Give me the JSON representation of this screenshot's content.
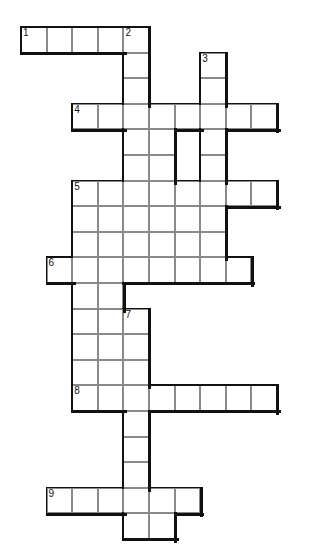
{
  "puzzle": {
    "type": "crossword-grid",
    "title": "",
    "cell_size": 25.6,
    "origin": {
      "x": 21,
      "y": 27
    },
    "cols": 11,
    "rows": 20,
    "colors": {
      "cell_fill": "#ffffff",
      "cell_border": "#8a8a8a",
      "heavy_border": "#111111",
      "number_text": "#111111",
      "background": "#ffffff"
    },
    "numbers": [
      {
        "label": "1",
        "col": 0,
        "row": 0
      },
      {
        "label": "2",
        "col": 4,
        "row": 0
      },
      {
        "label": "3",
        "col": 7,
        "row": 1
      },
      {
        "label": "4",
        "col": 2,
        "row": 3
      },
      {
        "label": "5",
        "col": 2,
        "row": 6
      },
      {
        "label": "6",
        "col": 1,
        "row": 9
      },
      {
        "label": "7",
        "col": 4,
        "row": 11
      },
      {
        "label": "8",
        "col": 2,
        "row": 14
      },
      {
        "label": "9",
        "col": 1,
        "row": 18
      }
    ],
    "cells": [
      {
        "col": 0,
        "row": 0
      },
      {
        "col": 1,
        "row": 0
      },
      {
        "col": 2,
        "row": 0
      },
      {
        "col": 3,
        "row": 0
      },
      {
        "col": 4,
        "row": 0
      },
      {
        "col": 4,
        "row": 1
      },
      {
        "col": 7,
        "row": 1
      },
      {
        "col": 4,
        "row": 2
      },
      {
        "col": 7,
        "row": 2
      },
      {
        "col": 2,
        "row": 3
      },
      {
        "col": 3,
        "row": 3
      },
      {
        "col": 4,
        "row": 3
      },
      {
        "col": 5,
        "row": 3
      },
      {
        "col": 6,
        "row": 3
      },
      {
        "col": 7,
        "row": 3
      },
      {
        "col": 8,
        "row": 3
      },
      {
        "col": 9,
        "row": 3
      },
      {
        "col": 4,
        "row": 4
      },
      {
        "col": 5,
        "row": 4
      },
      {
        "col": 7,
        "row": 4
      },
      {
        "col": 4,
        "row": 5
      },
      {
        "col": 5,
        "row": 5
      },
      {
        "col": 7,
        "row": 5
      },
      {
        "col": 2,
        "row": 6
      },
      {
        "col": 3,
        "row": 6
      },
      {
        "col": 4,
        "row": 6
      },
      {
        "col": 5,
        "row": 6
      },
      {
        "col": 6,
        "row": 6
      },
      {
        "col": 7,
        "row": 6
      },
      {
        "col": 8,
        "row": 6
      },
      {
        "col": 9,
        "row": 6
      },
      {
        "col": 2,
        "row": 7
      },
      {
        "col": 3,
        "row": 7
      },
      {
        "col": 4,
        "row": 7
      },
      {
        "col": 5,
        "row": 7
      },
      {
        "col": 6,
        "row": 7
      },
      {
        "col": 7,
        "row": 7
      },
      {
        "col": 2,
        "row": 8
      },
      {
        "col": 3,
        "row": 8
      },
      {
        "col": 4,
        "row": 8
      },
      {
        "col": 5,
        "row": 8
      },
      {
        "col": 6,
        "row": 8
      },
      {
        "col": 7,
        "row": 8
      },
      {
        "col": 1,
        "row": 9
      },
      {
        "col": 2,
        "row": 9
      },
      {
        "col": 3,
        "row": 9
      },
      {
        "col": 4,
        "row": 9
      },
      {
        "col": 5,
        "row": 9
      },
      {
        "col": 6,
        "row": 9
      },
      {
        "col": 7,
        "row": 9
      },
      {
        "col": 8,
        "row": 9
      },
      {
        "col": 2,
        "row": 10
      },
      {
        "col": 3,
        "row": 10
      },
      {
        "col": 2,
        "row": 11
      },
      {
        "col": 3,
        "row": 11
      },
      {
        "col": 4,
        "row": 11
      },
      {
        "col": 2,
        "row": 12
      },
      {
        "col": 3,
        "row": 12
      },
      {
        "col": 4,
        "row": 12
      },
      {
        "col": 2,
        "row": 13
      },
      {
        "col": 3,
        "row": 13
      },
      {
        "col": 4,
        "row": 13
      },
      {
        "col": 2,
        "row": 14
      },
      {
        "col": 3,
        "row": 14
      },
      {
        "col": 4,
        "row": 14
      },
      {
        "col": 5,
        "row": 14
      },
      {
        "col": 6,
        "row": 14
      },
      {
        "col": 7,
        "row": 14
      },
      {
        "col": 8,
        "row": 14
      },
      {
        "col": 9,
        "row": 14
      },
      {
        "col": 4,
        "row": 15
      },
      {
        "col": 4,
        "row": 16
      },
      {
        "col": 4,
        "row": 17
      },
      {
        "col": 1,
        "row": 18
      },
      {
        "col": 2,
        "row": 18
      },
      {
        "col": 3,
        "row": 18
      },
      {
        "col": 4,
        "row": 18
      },
      {
        "col": 5,
        "row": 18
      },
      {
        "col": 6,
        "row": 18
      },
      {
        "col": 4,
        "row": 19
      },
      {
        "col": 5,
        "row": 19
      }
    ]
  }
}
